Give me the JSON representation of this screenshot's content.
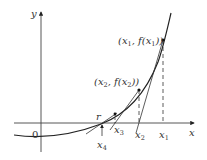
{
  "diagram": {
    "axes": {
      "x_label": "x",
      "y_label": "y",
      "origin_label": "0"
    },
    "points": [
      {
        "name": "x1",
        "label": "(x1, f(x1))",
        "tick_label": "x1"
      },
      {
        "name": "x2",
        "label": "(x2, f(x2))",
        "tick_label": "x2"
      },
      {
        "name": "x3",
        "label": "",
        "tick_label": "x3"
      },
      {
        "name": "x4",
        "label": "",
        "tick_label": "x4"
      }
    ],
    "root_label": "r",
    "colors": {
      "line": "#333333",
      "background": "#ffffff"
    }
  }
}
